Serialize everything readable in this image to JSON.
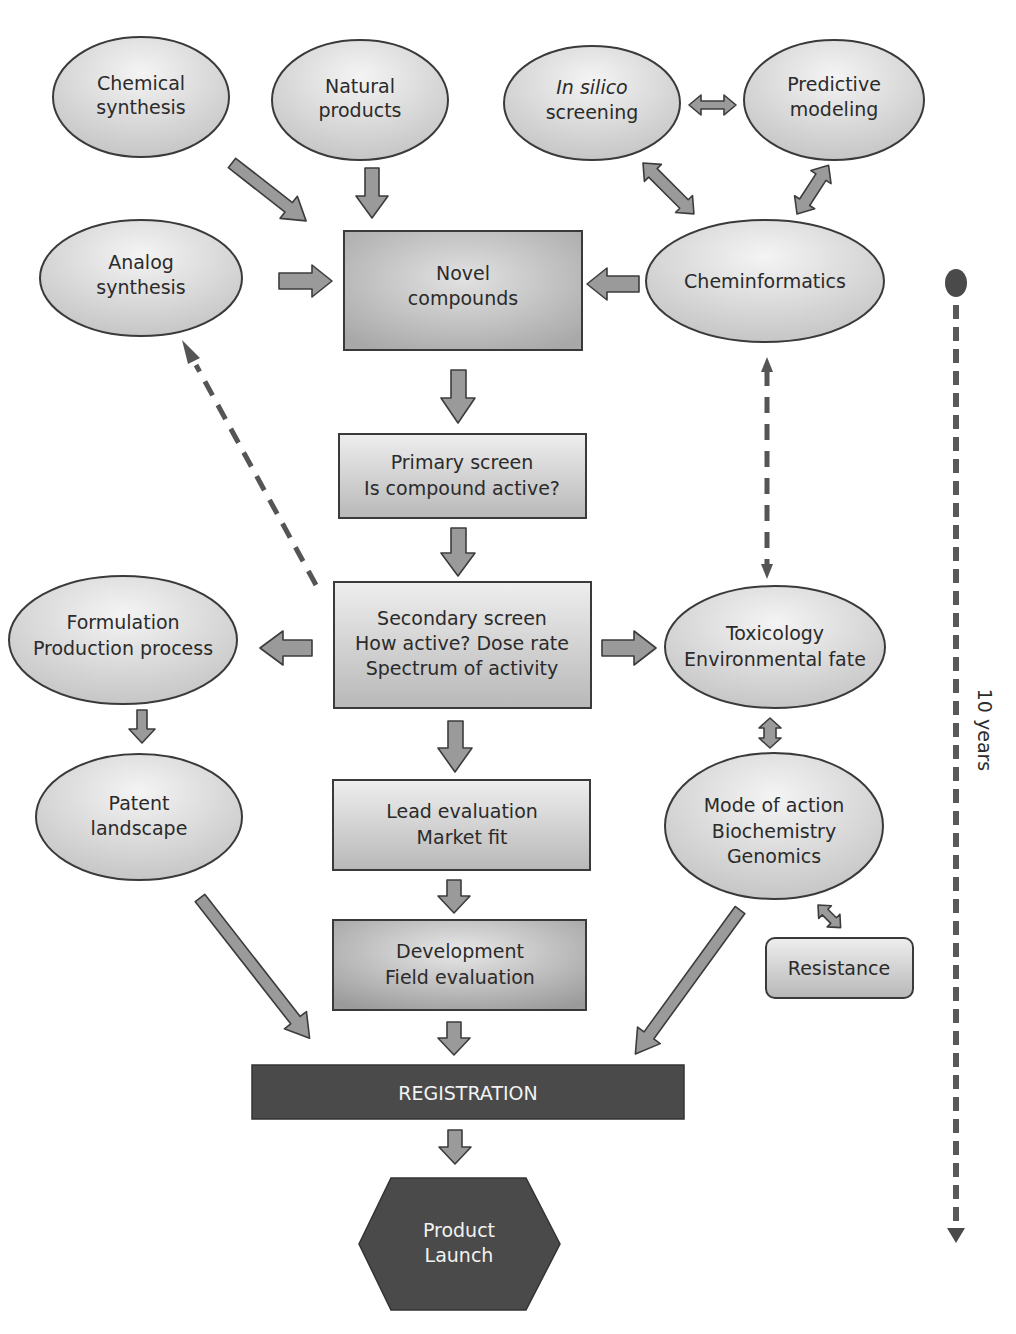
{
  "diagram": {
    "title": "",
    "nodes": {
      "chemical_synthesis": {
        "lines": [
          "Chemical",
          "synthesis"
        ],
        "shape": "ellipse"
      },
      "natural_products": {
        "lines": [
          "Natural",
          "products"
        ],
        "shape": "ellipse"
      },
      "in_silico_screening": {
        "lines": [
          "In silico",
          "screening"
        ],
        "italic_first_line": true,
        "shape": "ellipse"
      },
      "predictive_modeling": {
        "lines": [
          "Predictive",
          "modeling"
        ],
        "shape": "ellipse"
      },
      "analog_synthesis": {
        "lines": [
          "Analog",
          "synthesis"
        ],
        "shape": "ellipse"
      },
      "novel_compounds": {
        "lines": [
          "Novel",
          "compounds"
        ],
        "shape": "rect"
      },
      "cheminformatics": {
        "lines": [
          "Cheminformatics"
        ],
        "shape": "ellipse"
      },
      "primary_screen": {
        "lines": [
          "Primary screen",
          "Is compound active?"
        ],
        "shape": "rect"
      },
      "formulation": {
        "lines": [
          "Formulation",
          "Production process"
        ],
        "shape": "ellipse"
      },
      "secondary_screen": {
        "lines": [
          "Secondary screen",
          "How active?  Dose rate",
          "Spectrum of activity"
        ],
        "shape": "rect"
      },
      "toxicology": {
        "lines": [
          "Toxicology",
          "Environmental fate"
        ],
        "shape": "ellipse"
      },
      "patent_landscape": {
        "lines": [
          "Patent",
          "landscape"
        ],
        "shape": "ellipse"
      },
      "lead_evaluation": {
        "lines": [
          "Lead evaluation",
          "Market fit"
        ],
        "shape": "rect"
      },
      "mode_of_action": {
        "lines": [
          "Mode of action",
          "Biochemistry",
          "Genomics"
        ],
        "shape": "ellipse"
      },
      "development": {
        "lines": [
          "Development",
          "Field evaluation"
        ],
        "shape": "rect"
      },
      "resistance": {
        "lines": [
          "Resistance"
        ],
        "shape": "rounded-rect"
      },
      "registration": {
        "lines": [
          "REGISTRATION"
        ],
        "shape": "dark-rect"
      },
      "product_launch": {
        "lines": [
          "Product",
          "Launch"
        ],
        "shape": "dark-hexagon"
      }
    },
    "edges": [
      {
        "from": "chemical_synthesis",
        "to": "novel_compounds",
        "style": "solid"
      },
      {
        "from": "natural_products",
        "to": "novel_compounds",
        "style": "solid"
      },
      {
        "from": "in_silico_screening",
        "to": "predictive_modeling",
        "style": "double"
      },
      {
        "from": "in_silico_screening",
        "to": "cheminformatics",
        "style": "double"
      },
      {
        "from": "predictive_modeling",
        "to": "cheminformatics",
        "style": "double"
      },
      {
        "from": "analog_synthesis",
        "to": "novel_compounds",
        "style": "solid"
      },
      {
        "from": "cheminformatics",
        "to": "novel_compounds",
        "style": "solid"
      },
      {
        "from": "novel_compounds",
        "to": "primary_screen",
        "style": "solid"
      },
      {
        "from": "primary_screen",
        "to": "secondary_screen",
        "style": "solid"
      },
      {
        "from": "secondary_screen",
        "to": "analog_synthesis",
        "style": "dashed"
      },
      {
        "from": "toxicology",
        "to": "cheminformatics",
        "style": "dashed-double"
      },
      {
        "from": "secondary_screen",
        "to": "formulation",
        "style": "solid"
      },
      {
        "from": "secondary_screen",
        "to": "toxicology",
        "style": "solid"
      },
      {
        "from": "formulation",
        "to": "patent_landscape",
        "style": "solid"
      },
      {
        "from": "secondary_screen",
        "to": "lead_evaluation",
        "style": "solid"
      },
      {
        "from": "toxicology",
        "to": "mode_of_action",
        "style": "double"
      },
      {
        "from": "mode_of_action",
        "to": "resistance",
        "style": "double"
      },
      {
        "from": "lead_evaluation",
        "to": "development",
        "style": "solid"
      },
      {
        "from": "patent_landscape",
        "to": "registration",
        "style": "solid"
      },
      {
        "from": "mode_of_action",
        "to": "registration",
        "style": "solid"
      },
      {
        "from": "development",
        "to": "registration",
        "style": "solid"
      },
      {
        "from": "registration",
        "to": "product_launch",
        "style": "solid"
      }
    ],
    "timeline": {
      "label": "10 years"
    }
  },
  "colors": {
    "node_fill_light": "#ececec",
    "node_fill_mid": "#c9c9c9",
    "node_stroke": "#3a3a3a",
    "arrow_fill": "#9a9a9a",
    "dark_fill": "#4a4a4a",
    "dark_text": "#f2f2f2"
  }
}
